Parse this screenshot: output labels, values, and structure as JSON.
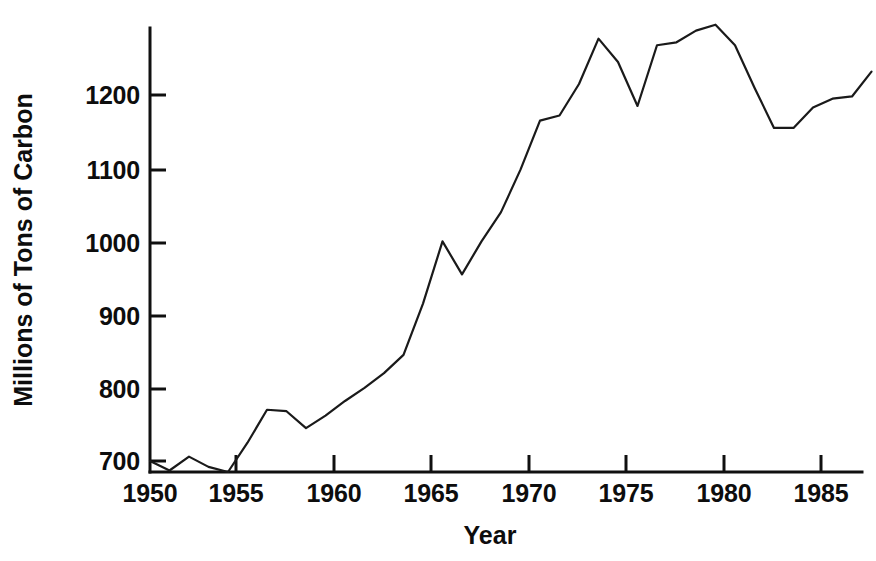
{
  "chart_data": {
    "type": "line",
    "title": "",
    "subtitle": "",
    "xlabel": "Year",
    "ylabel": "Millions of Tons of Carbon",
    "xlim": [
      1949.3,
      1987.4
    ],
    "ylim": [
      683,
      1302
    ],
    "grid": false,
    "legend": null,
    "x_ticks": [
      1950,
      1955,
      1960,
      1965,
      1970,
      1975,
      1980,
      1985
    ],
    "x_tick_labels": [
      "1950",
      "1955",
      "1960",
      "1965",
      "1970",
      "1975",
      "1980",
      "1985"
    ],
    "y_ticks": [
      700,
      800,
      900,
      1000,
      1100,
      1200
    ],
    "y_tick_labels": [
      "700",
      "800",
      "900",
      "1000",
      "1100",
      "1200"
    ],
    "line_color": "#1a1a1a",
    "x": [
      1950,
      1951,
      1952,
      1953,
      1954,
      1955,
      1956,
      1957,
      1958,
      1959,
      1960,
      1961,
      1962,
      1963,
      1964,
      1965,
      1966,
      1967,
      1968,
      1969,
      1970,
      1971,
      1972,
      1973,
      1974,
      1975,
      1976,
      1977,
      1978,
      1979,
      1980,
      1981,
      1982,
      1983,
      1984,
      1985,
      1986,
      1987
    ],
    "values": [
      700,
      687,
      706,
      692,
      683,
      725,
      770,
      768,
      745,
      762,
      782,
      800,
      820,
      845,
      915,
      1000,
      955,
      1000,
      1040,
      1098,
      1165,
      1172,
      1215,
      1277,
      1245,
      1185,
      1268,
      1272,
      1288,
      1296,
      1268,
      1210,
      1155,
      1155,
      1183,
      1195,
      1198,
      1232
    ],
    "series": [
      {
        "name": "Global carbon emissions",
        "values": [
          700,
          687,
          706,
          692,
          683,
          725,
          770,
          768,
          745,
          762,
          782,
          800,
          820,
          845,
          915,
          1000,
          955,
          1000,
          1040,
          1098,
          1165,
          1172,
          1215,
          1277,
          1245,
          1185,
          1268,
          1272,
          1288,
          1296,
          1268,
          1210,
          1155,
          1155,
          1183,
          1195,
          1198,
          1232
        ]
      }
    ]
  },
  "axes": {
    "y_title": "Millions of Tons of Carbon",
    "x_title": "Year"
  },
  "y_labels": [
    "1200",
    "1100",
    "1000",
    "900",
    "800",
    "700"
  ],
  "x_labels": [
    "1950",
    "1955",
    "1960",
    "1965",
    "1970",
    "1975",
    "1980",
    "1985"
  ]
}
